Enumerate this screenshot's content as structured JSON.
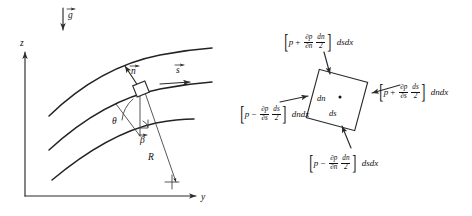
{
  "figure": {
    "background_color": "#ffffff",
    "ink_color": "#232323",
    "panels": [
      {
        "id": "streamline-coordinates",
        "name": "Streamline coordinate system panel"
      },
      {
        "id": "pressure-forces",
        "name": "Pressure forces on fluid element panel"
      }
    ]
  },
  "left_panel": {
    "axes": {
      "vertical_label": "z",
      "horizontal_label": "y"
    },
    "gravity": {
      "label": "g",
      "direction": "down",
      "is_vector": true
    },
    "streamlines": {
      "count": 3,
      "description": "three concave-down curved streamlines"
    },
    "element": {
      "description": "small rotated square fluid element on middle streamline"
    },
    "vectors": {
      "normal_label": "n",
      "tangent_label": "s",
      "normal_is_vector": true,
      "tangent_is_vector": true
    },
    "angles": {
      "theta_label": "θ",
      "beta_label": "β",
      "beta_is_vector": true
    },
    "radius": {
      "label": "R",
      "description": "radius of curvature from element to center of curvature"
    },
    "center_of_curvature": {
      "marker": "cross"
    }
  },
  "right_panel": {
    "element": {
      "inner_label_n": "dn",
      "inner_label_s": "ds",
      "center_dot": "•",
      "rotation_deg": 15
    },
    "forces": {
      "top": {
        "name": "top-face-pressure-force",
        "p": "p",
        "op": "+",
        "num": "∂p",
        "den": "∂n",
        "fnum": "dn",
        "fden": "2",
        "area": "dsdx",
        "arrow_direction": "down"
      },
      "right": {
        "name": "right-face-pressure-force",
        "p": "p",
        "op": "+",
        "num": "∂p",
        "den": "∂s",
        "fnum": "ds",
        "fden": "2",
        "area": "dndx",
        "arrow_direction": "left"
      },
      "left": {
        "name": "left-face-pressure-force",
        "p": "p",
        "op": "−",
        "num": "∂p",
        "den": "∂s",
        "fnum": "ds",
        "fden": "2",
        "area": "dndx",
        "arrow_direction": "right"
      },
      "bottom": {
        "name": "bottom-face-pressure-force",
        "p": "p",
        "op": "−",
        "num": "∂p",
        "den": "∂n",
        "fnum": "dn",
        "fden": "2",
        "area": "dsdx",
        "arrow_direction": "up"
      }
    }
  }
}
